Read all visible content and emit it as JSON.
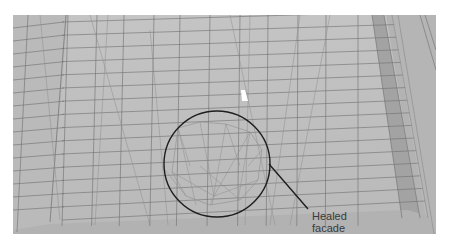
{
  "figure": {
    "colors": {
      "background": "#ffffff",
      "facade": "#bdbdbd",
      "facade_left": "#b8b8b8",
      "facade_right": "#b4b4b4",
      "ground": "#b0b0b0",
      "grid_line": "#6f6f6f",
      "tri_line": "#8e8e8e",
      "recess": "#9a9a9a",
      "callout": "#1e1e1e",
      "marker": "#ffffff"
    }
  },
  "callout": {
    "label_line1": "Healed",
    "label_line2": "facade",
    "target": "circled triangulated patch of the facade mesh"
  }
}
